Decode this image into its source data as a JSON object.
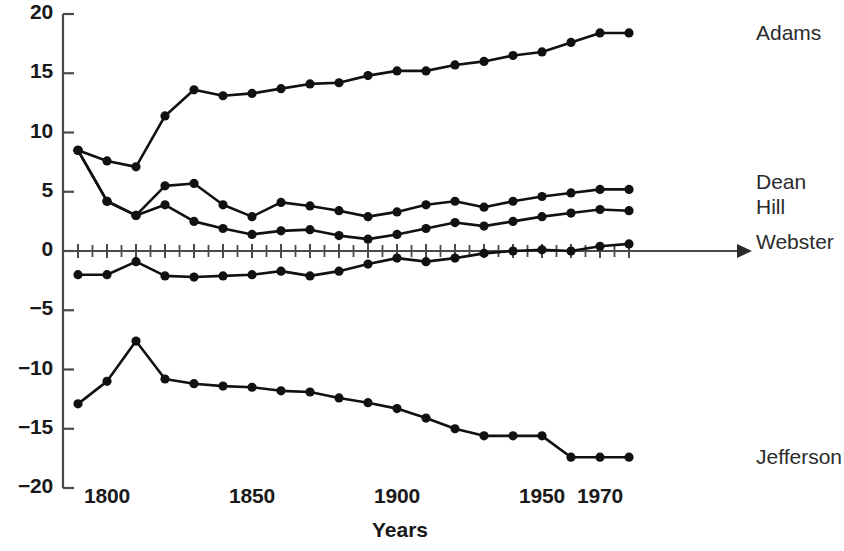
{
  "chart_data": {
    "type": "line",
    "title": "",
    "subtitle": "",
    "xlabel": "Years",
    "ylabel": "",
    "xlim": [
      1790,
      1982
    ],
    "ylim": [
      -20,
      20
    ],
    "grid": false,
    "legend_position": "right-of-plot-end-labels",
    "y_ticks": [
      20,
      15,
      10,
      5,
      0,
      -5,
      -10,
      -15,
      -20
    ],
    "y_tick_labels": [
      "20",
      "15",
      "10",
      "5",
      "0",
      "−5",
      "−10",
      "−15",
      "−20"
    ],
    "x_ticks": [
      1800,
      1850,
      1900,
      1950,
      1970
    ],
    "x_tick_labels": [
      "1800",
      "1850",
      "1900",
      "1950",
      "1970"
    ],
    "x": [
      1790,
      1800,
      1810,
      1820,
      1830,
      1840,
      1850,
      1860,
      1870,
      1880,
      1890,
      1900,
      1910,
      1920,
      1930,
      1940,
      1950,
      1960,
      1970,
      1980
    ],
    "series": [
      {
        "name": "Adams",
        "values": [
          8.5,
          7.6,
          7.1,
          11.4,
          13.6,
          13.1,
          13.3,
          13.7,
          14.1,
          14.2,
          14.8,
          15.2,
          15.2,
          15.7,
          16.0,
          16.5,
          16.8,
          17.6,
          18.4,
          18.4
        ],
        "marker": "filled-circle",
        "color": "#111111"
      },
      {
        "name": "Dean",
        "values": [
          8.5,
          4.2,
          3.0,
          5.5,
          5.7,
          3.9,
          2.9,
          4.1,
          3.8,
          3.4,
          2.9,
          3.3,
          3.9,
          4.2,
          3.7,
          4.2,
          4.6,
          4.9,
          5.2,
          5.2
        ],
        "marker": "filled-circle",
        "color": "#111111"
      },
      {
        "name": "Hill",
        "values": [
          8.5,
          4.2,
          3.0,
          3.9,
          2.5,
          1.9,
          1.4,
          1.7,
          1.8,
          1.3,
          1.0,
          1.4,
          1.9,
          2.4,
          2.1,
          2.5,
          2.9,
          3.2,
          3.5,
          3.4
        ],
        "marker": "filled-circle",
        "color": "#111111"
      },
      {
        "name": "Webster",
        "values": [
          -2.0,
          -2.0,
          -0.9,
          -2.1,
          -2.2,
          -2.1,
          -2.0,
          -1.7,
          -2.1,
          -1.7,
          -1.1,
          -0.6,
          -0.9,
          -0.6,
          -0.2,
          0.0,
          0.1,
          0.0,
          0.4,
          0.6
        ],
        "marker": "filled-circle",
        "color": "#111111"
      },
      {
        "name": "Jefferson",
        "values": [
          -12.9,
          -11.0,
          -7.6,
          -10.8,
          -11.2,
          -11.4,
          -11.5,
          -11.8,
          -11.9,
          -12.4,
          -12.8,
          -13.3,
          -14.1,
          -15.0,
          -15.6,
          -15.6,
          -15.6,
          -17.4,
          -17.4,
          -17.4
        ],
        "marker": "filled-circle",
        "color": "#111111"
      }
    ],
    "end_labels": [
      {
        "text": "Adams",
        "series": "Adams"
      },
      {
        "text": "Dean",
        "series": "Dean"
      },
      {
        "text": "Hill",
        "series": "Hill"
      },
      {
        "text": "Webster",
        "series": "Webster"
      },
      {
        "text": "Jefferson",
        "series": "Jefferson"
      }
    ]
  },
  "axis": {
    "x_title": "Years",
    "y_ticks": [
      "20",
      "15",
      "10",
      "5",
      "0",
      "−5",
      "−10",
      "−15",
      "−20"
    ],
    "x_ticks": [
      "1800",
      "1850",
      "1900",
      "1950",
      "1970"
    ]
  },
  "labels": {
    "adams": "Adams",
    "dean": "Dean",
    "hill": "Hill",
    "webster": "Webster",
    "jefferson": "Jefferson"
  }
}
